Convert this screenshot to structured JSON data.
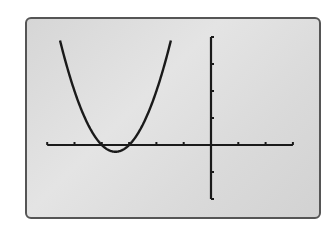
{
  "chart_data": {
    "type": "line",
    "title": "",
    "xlabel": "",
    "ylabel": "",
    "xlim": [
      -6,
      3
    ],
    "ylim": [
      -2,
      4
    ],
    "x_tick_step": 1,
    "y_tick_step": 1,
    "grid": false,
    "legend": null,
    "series": [
      {
        "name": "y = x^2 + 7x + 12",
        "function": "(x+3)*(x+4)",
        "x": [
          -5.5,
          -5.0,
          -4.5,
          -4.0,
          -3.5,
          -3.0,
          -2.5,
          -2.0,
          -1.5
        ],
        "values": [
          3.75,
          2.0,
          0.75,
          0.0,
          -0.25,
          0.0,
          0.75,
          2.0,
          3.75
        ]
      }
    ],
    "annotations": {
      "roots": [
        -4,
        -3
      ],
      "vertex": [
        -3.5,
        -0.25
      ]
    }
  },
  "colors": {
    "screen_background": "#dcdcdc",
    "curve": "#1a1a1a",
    "axes": "#1a1a1a",
    "frame_border": "#555555"
  }
}
